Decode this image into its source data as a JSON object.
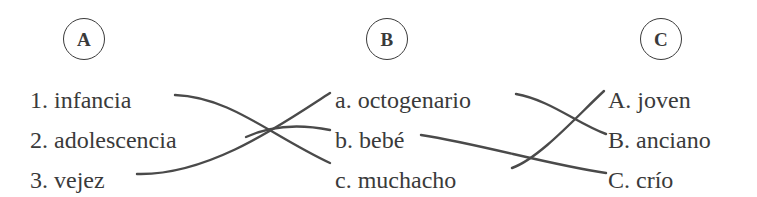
{
  "exercise": {
    "type": "matching-exercise",
    "background_color": "#ffffff",
    "text_color": "#3a3a3a",
    "line_color": "#4a4a4a"
  },
  "columns": [
    {
      "id": "A",
      "badge_label": "A",
      "items": [
        {
          "marker": "1.",
          "text": "infancia"
        },
        {
          "marker": "2.",
          "text": "adolescencia"
        },
        {
          "marker": "3.",
          "text": "vejez"
        }
      ]
    },
    {
      "id": "B",
      "badge_label": "B",
      "items": [
        {
          "marker": "a.",
          "text": "octogenario"
        },
        {
          "marker": "b.",
          "text": "bebé"
        },
        {
          "marker": "c.",
          "text": "muchacho"
        }
      ]
    },
    {
      "id": "C",
      "badge_label": "C",
      "items": [
        {
          "marker": "A.",
          "text": "joven"
        },
        {
          "marker": "B.",
          "text": "anciano"
        },
        {
          "marker": "C.",
          "text": "crío"
        }
      ]
    }
  ],
  "connections": [
    {
      "from": "1",
      "to": "c",
      "group": "left"
    },
    {
      "from": "2",
      "to": "b",
      "group": "left"
    },
    {
      "from": "3",
      "to": "a",
      "group": "left"
    },
    {
      "from": "a",
      "to": "B",
      "group": "right"
    },
    {
      "from": "b",
      "to": "C",
      "group": "right"
    },
    {
      "from": "c",
      "to": "A",
      "group": "right"
    }
  ]
}
